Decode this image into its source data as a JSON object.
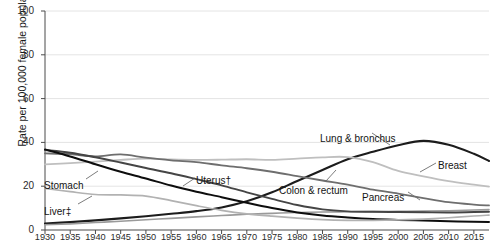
{
  "chart_data": {
    "type": "line",
    "title": "",
    "subtitle": "",
    "xlabel": "",
    "ylabel": "Rate per 100,000 female population",
    "xlim": [
      1930,
      2018
    ],
    "ylim": [
      0,
      100
    ],
    "yticks": [
      0,
      20,
      40,
      60,
      80,
      100
    ],
    "xticks": [
      1930,
      1935,
      1940,
      1945,
      1950,
      1955,
      1960,
      1965,
      1970,
      1975,
      1980,
      1985,
      1990,
      1995,
      2000,
      2005,
      2010,
      2015
    ],
    "grid": "horizontal",
    "legend": "inline-annotations",
    "x": [
      1930,
      1935,
      1940,
      1945,
      1950,
      1955,
      1960,
      1965,
      1970,
      1975,
      1980,
      1985,
      1990,
      1995,
      2000,
      2005,
      2010,
      2015,
      2018
    ],
    "series": [
      {
        "name": "Lung & bronchus",
        "color": "#1c1c1c",
        "width": 2.1,
        "values": [
          3.0,
          3.6,
          4.4,
          5.3,
          6.3,
          7.4,
          8.6,
          10.3,
          13.1,
          17.2,
          22.4,
          27.4,
          32.3,
          35.7,
          38.7,
          40.7,
          38.9,
          34.8,
          31.5
        ],
        "label_text": "Lung & bronchus",
        "label_x": 320,
        "label_y": 133
      },
      {
        "name": "Breast",
        "color": "#bfbfbf",
        "width": 1.8,
        "values": [
          30.0,
          30.5,
          31.2,
          32.0,
          32.6,
          32.2,
          32.0,
          32.1,
          32.3,
          32.0,
          32.6,
          33.2,
          33.3,
          31.0,
          27.0,
          24.5,
          22.3,
          20.7,
          19.8
        ],
        "label_text": "Breast",
        "label_x": 438,
        "label_y": 160
      },
      {
        "name": "Colon & rectum",
        "color": "#6e6e6e",
        "width": 1.8,
        "values": [
          35.0,
          34.6,
          33.6,
          34.5,
          33.0,
          31.8,
          31.0,
          29.5,
          28.2,
          26.6,
          24.6,
          22.6,
          20.7,
          18.4,
          16.6,
          14.6,
          12.7,
          11.6,
          11.2
        ],
        "label_text": "Colon & rectum",
        "label_x": 279,
        "label_y": 185
      },
      {
        "name": "Pancreas",
        "color": "#9a9a9a",
        "width": 1.6,
        "values": [
          2.4,
          2.8,
          3.4,
          4.0,
          4.7,
          5.3,
          6.0,
          6.6,
          7.2,
          7.6,
          8.0,
          8.2,
          8.3,
          8.4,
          8.5,
          8.6,
          8.8,
          9.1,
          9.3
        ],
        "label_text": "Pancreas",
        "label_x": 362,
        "label_y": 192
      },
      {
        "name": "Uterus†",
        "color": "#454545",
        "width": 1.9,
        "values": [
          36.5,
          35.3,
          33.2,
          30.8,
          28.3,
          25.9,
          23.2,
          20.4,
          17.2,
          14.2,
          11.4,
          9.4,
          8.5,
          8.3,
          8.2,
          8.1,
          8.0,
          8.2,
          8.3
        ],
        "label_text": "Uterus†",
        "label_x": 196,
        "label_y": 175
      },
      {
        "name": "Stomach",
        "color": "#0d0d0d",
        "width": 2.0,
        "values": [
          36.8,
          33.6,
          30.0,
          26.6,
          23.5,
          20.3,
          17.5,
          15.0,
          12.4,
          10.0,
          8.0,
          6.6,
          5.7,
          5.0,
          4.6,
          4.3,
          4.0,
          3.8,
          3.7
        ],
        "label_text": "Stomach",
        "label_x": 44,
        "label_y": 180
      },
      {
        "name": "Liver‡",
        "color": "#b2b2b2",
        "width": 1.7,
        "values": [
          19.0,
          17.5,
          16.2,
          16.0,
          15.5,
          13.4,
          11.1,
          9.0,
          7.4,
          6.3,
          5.4,
          4.7,
          4.4,
          4.4,
          4.6,
          5.0,
          5.6,
          6.4,
          6.8
        ],
        "label_text": "Liver‡",
        "label_x": 44,
        "label_y": 206
      }
    ],
    "leader_lines": [
      {
        "name": "lung-leader",
        "x1": 372,
        "y1": 133,
        "x2": 390,
        "y2": 145
      },
      {
        "name": "breast-leader",
        "x1": 436,
        "y1": 163,
        "x2": 420,
        "y2": 172
      },
      {
        "name": "colon-leader",
        "x1": 326,
        "y1": 181,
        "x2": 336,
        "y2": 170
      },
      {
        "name": "pancreas-leader",
        "x1": 408,
        "y1": 192,
        "x2": 420,
        "y2": 200
      },
      {
        "name": "uterus-leader",
        "x1": 195,
        "y1": 178,
        "x2": 183,
        "y2": 186
      },
      {
        "name": "stomach-leader",
        "x1": 86,
        "y1": 179,
        "x2": 98,
        "y2": 171
      },
      {
        "name": "liver-leader",
        "x1": 78,
        "y1": 204,
        "x2": 92,
        "y2": 196
      }
    ]
  }
}
